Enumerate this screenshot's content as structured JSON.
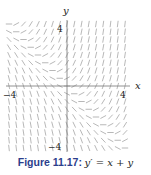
{
  "chart_data": {
    "type": "slope_field",
    "title": "",
    "equation": "y' = x + y",
    "xlabel": "x",
    "ylabel": "y",
    "xlim": [
      -4,
      4
    ],
    "ylim": [
      -4,
      4
    ],
    "xticks": [
      {
        "value": -4,
        "label": "−4"
      },
      {
        "value": 4,
        "label": "4"
      }
    ],
    "yticks": [
      {
        "value": 4,
        "label": "4"
      },
      {
        "value": -4,
        "label": "−4"
      }
    ],
    "grid": false,
    "field": {
      "dx": 0.5,
      "dy": 0.5,
      "x_range": [
        -4,
        4
      ],
      "y_range": [
        -4,
        4
      ]
    },
    "colors": {
      "segments": "#9a9a9a",
      "axes": "#777777",
      "text": "#222222",
      "caption_label": "#2c3e8c"
    }
  },
  "caption": {
    "label": "Figure 11.17:",
    "equation": "y′ = x + y"
  },
  "labels": {
    "x_axis": "x",
    "y_axis": "y",
    "x_min": "−4",
    "x_max": "4",
    "y_max": "4",
    "y_min": "−4"
  }
}
